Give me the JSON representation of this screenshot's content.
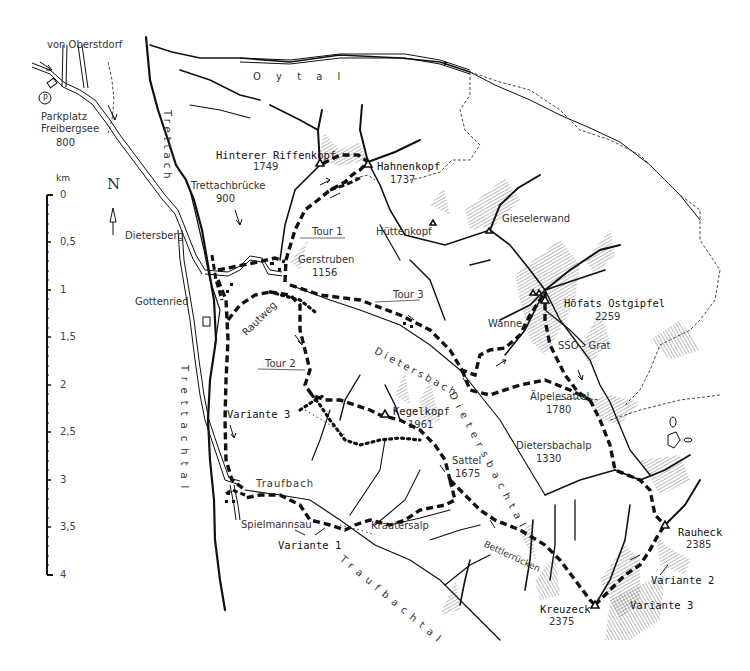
{
  "map": {
    "origin_label": "von Oberstdorf",
    "parking": {
      "symbol": "P",
      "name_line1": "Parkplatz",
      "name_line2": "Freibergsee",
      "elevation": "800"
    },
    "north_arrow": {
      "label": "N"
    },
    "scale": {
      "unit": "km",
      "ticks": [
        "0",
        "0,5",
        "1",
        "1,5",
        "2",
        "2,5",
        "3",
        "3,5",
        "4"
      ]
    },
    "valleys": {
      "oytal": "O y t a l",
      "trettach": "Trettach",
      "trettachtal": "Trettachtal",
      "dietersbach": "Dietersbach",
      "dietersbachtal": "Dietersbachtal",
      "traufbachtal": "Traufbachtal"
    },
    "places": {
      "hinterer_riffenkopf": {
        "name": "Hinterer Riffenkopf",
        "elevation": "1749"
      },
      "hahnenkopf": {
        "name": "Hahnenkopf",
        "elevation": "1737"
      },
      "trettachbruecke": {
        "name": "Trettachbrücke",
        "elevation": "900"
      },
      "dietersberg": {
        "name": "Dietersberg"
      },
      "huettenkopf": {
        "name": "Hüttenkopf"
      },
      "gieselerwand": {
        "name": "Gieselerwand"
      },
      "gerstruben": {
        "name": "Gerstruben",
        "elevation": "1156"
      },
      "gottenried": {
        "name": "Gottenried"
      },
      "rautweg": {
        "name": "Rautweg"
      },
      "hoefats": {
        "name": "Höfats Ostgipfel",
        "elevation": "2259"
      },
      "wanne": {
        "name": "Wanne"
      },
      "sso_grat": {
        "name": "SSO - Grat"
      },
      "aelpelesattel": {
        "name": "Älpelesattel",
        "elevation": "1780"
      },
      "kegelkopf": {
        "name": "Kegelkopf",
        "elevation": "1961"
      },
      "dietersbachalp": {
        "name": "Dietersbachalp",
        "elevation": "1330"
      },
      "sattel": {
        "name": "Sattel",
        "elevation": "1675"
      },
      "traufbach": {
        "name": "Traufbach"
      },
      "spielmannsau": {
        "name": "Spielmannsau"
      },
      "krautersalp": {
        "name": "Krautersalp"
      },
      "bettlerruecken": {
        "name": "Bettlerrücken"
      },
      "rauheck": {
        "name": "Rauheck",
        "elevation": "2385"
      },
      "kreuzeck": {
        "name": "Kreuzeck",
        "elevation": "2375"
      }
    },
    "routes": {
      "tour1": "Tour 1",
      "tour2": "Tour 2",
      "tour3": "Tour 3",
      "variante1": "Variante 1",
      "variante2": "Variante 2",
      "variante3_west": "Variante 3",
      "variante3_east": "Variante 3"
    },
    "colors": {
      "ink": "#111111",
      "paper": "#ffffff",
      "hatch": "#555555"
    }
  }
}
